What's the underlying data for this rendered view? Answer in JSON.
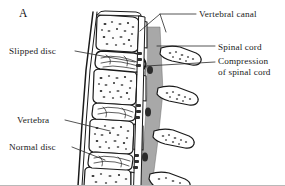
{
  "figure": {
    "panel_letter": "A",
    "background_color": "#ffffff",
    "ink_color": "#1a1a1a",
    "spinal_cord_fill": "#a8a8a8",
    "bone_fill": "#fdfdfd",
    "disc_fill": "#ffffff"
  },
  "labels": {
    "left": [
      {
        "id": "slipped-disc",
        "text": "Slipped disc"
      },
      {
        "id": "vertebra",
        "text": "Vertebra"
      },
      {
        "id": "normal-disc",
        "text": "Normal disc"
      }
    ],
    "right": [
      {
        "id": "vertebral-canal",
        "text": "Vertebral canal"
      },
      {
        "id": "spinal-cord",
        "text": "Spinal cord"
      },
      {
        "id": "compression-line1",
        "text": "Compression"
      },
      {
        "id": "compression-line2",
        "text": "of spinal cord"
      }
    ]
  },
  "anatomy": {
    "vertebrae_count": 4,
    "disc_count": 4,
    "spinous_process_count": 4,
    "slipped_disc_index": 1,
    "normal_disc_index": 3
  }
}
